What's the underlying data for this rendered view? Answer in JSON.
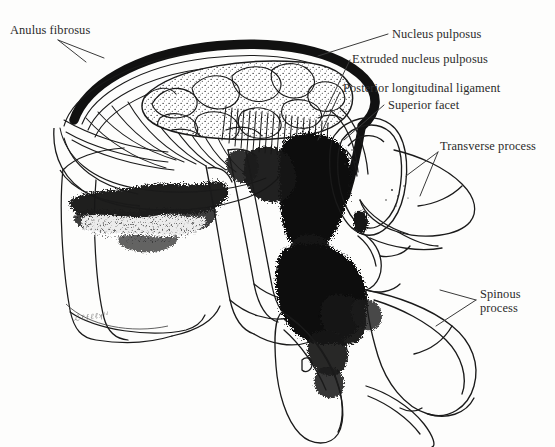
{
  "figure": {
    "domain": "medical-illustration",
    "style": "black-and-white pen-and-ink line drawing with stipple and solid black fill",
    "background_color": "#fdfdfc",
    "ink_color": "#1a1a1a",
    "label_color": "#2b2b2b"
  },
  "labels": {
    "anulus_fibrosus": "Anulus fibrosus",
    "nucleus_pulposus": "Nucleus pulposus",
    "extruded_nucleus_pulposus": "Extruded nucleus pulposus",
    "posterior_longitudinal_ligament": "Posterior longitudinal ligament",
    "superior_facet": "Superior facet",
    "transverse_process": "Transverse process",
    "spinous_process": "Spinous process"
  },
  "label_list": [
    {
      "id": "anulus-fibrosus",
      "text": "Anulus fibrosus",
      "side": "left",
      "lines": 1
    },
    {
      "id": "nucleus-pulposus",
      "text": "Nucleus pulposus",
      "side": "right",
      "lines": 1
    },
    {
      "id": "extruded-nucleus-pulposus",
      "text": "Extruded nucleus pulposus",
      "side": "right",
      "lines": 1
    },
    {
      "id": "posterior-longitudinal-ligament",
      "text": "Posterior longitudinal ligament",
      "side": "right",
      "lines": 1
    },
    {
      "id": "superior-facet",
      "text": "Superior facet",
      "side": "right",
      "lines": 1
    },
    {
      "id": "transverse-process",
      "text": "Transverse process",
      "side": "right",
      "lines": 2
    },
    {
      "id": "spinous-process",
      "text": "Spinous process",
      "side": "right",
      "lines": 2
    }
  ],
  "signature": {
    "text": "ℒℓƒℓℓʞˡᵈ",
    "note": "illegible cursive artist signature at lower left of vertebral body"
  }
}
